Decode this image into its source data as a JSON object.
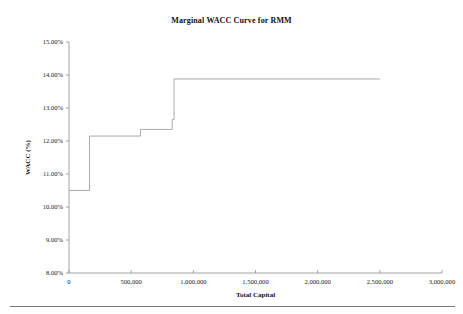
{
  "chart": {
    "title": "Marginal WACC Curve for RMM",
    "xlabel": "Total Capital",
    "ylabel": "WACC (%)"
  },
  "chart_data": {
    "type": "line",
    "title": "Marginal WACC Curve for RMM",
    "xlabel": "Total Capital",
    "ylabel": "WACC (%)",
    "subtitle": "",
    "grid": false,
    "legend": "none",
    "xlim": [
      0,
      3000000
    ],
    "ylim": [
      0.08,
      0.15
    ],
    "xticks": [
      0,
      500000,
      1000000,
      1500000,
      2000000,
      2500000,
      3000000
    ],
    "xticklabels": [
      "0",
      "500,000",
      "1,000,000",
      "1,500,000",
      "2,000,000",
      "2,500,000",
      "3,000,000"
    ],
    "yticks": [
      0.08,
      0.09,
      0.1,
      0.11,
      0.12,
      0.13,
      0.14,
      0.15
    ],
    "yticklabels": [
      "8.00%",
      "9.00%",
      "10.00%",
      "11.00%",
      "12.00%",
      "13.00%",
      "14.00%",
      "15.00%"
    ],
    "series": [
      {
        "name": "Marginal WACC",
        "style": "step-post",
        "breakpoints": [
          0,
          165000,
          575000,
          830000,
          845000,
          2500000
        ],
        "values": [
          0.105,
          0.1215,
          0.1235,
          0.1265,
          0.1388
        ],
        "points": [
          {
            "x": 0,
            "y": 0.105
          },
          {
            "x": 165000,
            "y": 0.105
          },
          {
            "x": 165000,
            "y": 0.1215
          },
          {
            "x": 575000,
            "y": 0.1215
          },
          {
            "x": 575000,
            "y": 0.1235
          },
          {
            "x": 830000,
            "y": 0.1235
          },
          {
            "x": 830000,
            "y": 0.1265
          },
          {
            "x": 845000,
            "y": 0.1265
          },
          {
            "x": 845000,
            "y": 0.1388
          },
          {
            "x": 2500000,
            "y": 0.1388
          }
        ]
      }
    ]
  },
  "colors": {
    "line": "#a0a0a0",
    "axis": "#8e8e8e",
    "text": "#1a1a1a",
    "background": "#ffffff"
  }
}
